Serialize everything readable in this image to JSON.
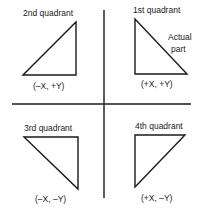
{
  "diagram": {
    "colors": {
      "line": "#1a1a1a",
      "background": "#ffffff"
    },
    "quadrants": [
      {
        "id": "q1",
        "title": "1st quadrant",
        "coords": "(+X, +Y)",
        "note_line1": "Actual",
        "note_line2": "part"
      },
      {
        "id": "q2",
        "title": "2nd quadrant",
        "coords": "(–X, +Y)"
      },
      {
        "id": "q3",
        "title": "3rd quadrant",
        "coords": "(–X, –Y)"
      },
      {
        "id": "q4",
        "title": "4th quadrant",
        "coords": "(+X, –Y)"
      }
    ]
  }
}
